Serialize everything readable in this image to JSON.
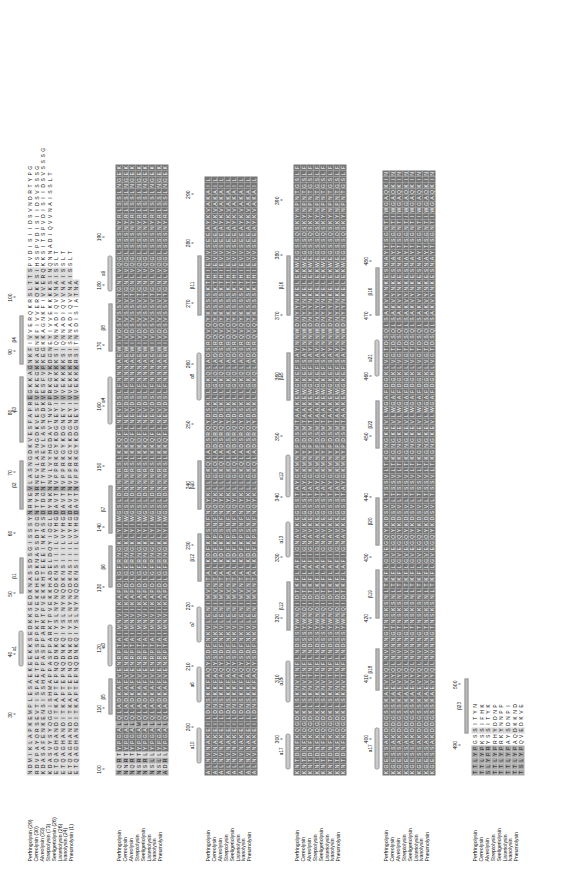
{
  "figure": {
    "type": "multiple-sequence-alignment",
    "orientation": "rotated-90-ccw",
    "block_count": 6,
    "sequence_count": 8
  },
  "sequences": [
    {
      "name": "Perfringolysin",
      "start_label": "Perfringolysin (29)",
      "start": 29
    },
    {
      "name": "Cereolysin",
      "start_label": "Cereolysin (30)",
      "start": 30
    },
    {
      "name": "Alveolysin",
      "start_label": "Alveolysin (33)",
      "start": 33
    },
    {
      "name": "Streptolysin",
      "start_label": "Streptolysin (73)",
      "start": 73
    },
    {
      "name": "Seeligeriolysin",
      "start_label": "Seeligeriolysin (26)",
      "start": 26
    },
    {
      "name": "Listeriolysin",
      "start_label": "Listeriolysin (26)",
      "start": 26
    },
    {
      "name": "Ivanolysin",
      "start_label": "Ivanolysin (24)",
      "start": 24
    },
    {
      "name": "Pneumolysin",
      "start_label": "Pneumolysin (1)",
      "start": 1
    }
  ],
  "names_plain": [
    "Perfringolysin",
    "Cereolysin",
    "Alveolysin",
    "Streptolysin",
    "Seeligeriolysin",
    "Listeriolysin",
    "Ivanolysin",
    "Pneumolysin"
  ],
  "colors": {
    "shade_light": "#d8d8d8",
    "shade_mid": "#a9a9a9",
    "shade_dark": "#767676",
    "ss_bar": "#b8b8b8",
    "text": "#111111",
    "background": "#ffffff"
  },
  "blocks": [
    {
      "id": "block-1",
      "range": [
        29,
        100
      ],
      "ruler": [
        {
          "value": "30",
          "col": 10
        },
        {
          "value": "40",
          "col": 20
        },
        {
          "value": "50",
          "col": 30
        },
        {
          "value": "60",
          "col": 40
        },
        {
          "value": "70",
          "col": 50
        },
        {
          "value": "80",
          "col": 60
        },
        {
          "value": "90",
          "col": 70
        },
        {
          "value": "100",
          "col": 79
        }
      ],
      "ss": [
        {
          "label": "α1",
          "type": "helix",
          "start": 18,
          "end": 24
        },
        {
          "label": "β 1",
          "type": "strand",
          "start": 30,
          "end": 36
        },
        {
          "label": "β2",
          "type": "strand",
          "start": 44,
          "end": 52
        },
        {
          "label": "β3",
          "type": "strand",
          "start": 55,
          "end": 66
        },
        {
          "label": "β4",
          "type": "strand",
          "start": 68,
          "end": 76
        }
      ],
      "rows": [
        "NDMIKLAPKEMPLESAEKEEKKSEDKKSEDKNASSDSGISSSYNRNEVLASNGDKVESFAPREGKKAGNKFIVVERQKRSLTTSPVDISIIDSVNDRTYPG",
        "RDVPAYQRSEVTISPAETPESSPPKTPVEKKHEDKNASSDTQGNTYNRNEVLASNGDKVESFVPKEGKKAGNKFIVVERQKKSIHSSPVDISIIDSVSSSG",
        "KDASAFENKENSISSHAPPASPPARKTPVEKKHTEEEINKASSDTDGNTYNRNEVLASNGDKVESFVPKEGKKAGNKFIVVERQKKSITSPVDISIIDSVSSSG",
        "KDASVYSYQGGISHMAPPASPPARKTPVEKKHADELDQYIQGLDYNKNNVLVYHGDAVTNVPPRKGYKDGNEYIVVEKKKKSINQNNADIQVVNAISSLT",
        "ETQAGHANDITKAPTEPNQDNKQIYSLNYNQDKNSIIILVYHGDAVTNVPPRKGYKDGNEYIVVEKKKKSIQNNADIQVVNAISSLT",
        "ETQAGHANDITKAPTEPNQDNKQIYSLNYNQDKNSIIILVYHGDAVTNVPPRKGYKDGNEYIVVEKKKKSIQNNADIQVVNAISSLT",
        "ETQAGHANDITKAPTEPNQDNKQIYSLNYNQDKNSIIILVYHGDAVTNVPPRKGYKDGNEYIVVEKKKRSISNNADIQVVNAISSLT",
        "ETQAGHANDITKAPTEPNQDNKQIYSLNYNQDKNSIIILVYHGDAVTNVPPRKGYKDGNEYIVVEKKKRSITNSDISIATNA"
      ]
    },
    {
      "id": "block-2",
      "range": [
        100,
        190
      ],
      "ruler": [
        {
          "value": "100",
          "col": 1
        },
        {
          "value": "110",
          "col": 11
        },
        {
          "value": "120",
          "col": 21
        },
        {
          "value": "130",
          "col": 31
        },
        {
          "value": "140",
          "col": 41
        },
        {
          "value": "150",
          "col": 51
        },
        {
          "value": "160",
          "col": 61
        },
        {
          "value": "170",
          "col": 71
        },
        {
          "value": "180",
          "col": 81
        },
        {
          "value": "190",
          "col": 89
        }
      ],
      "ss": [
        {
          "label": "β5",
          "type": "strand",
          "start": 10,
          "end": 16
        },
        {
          "label": "α3",
          "type": "helix",
          "start": 18,
          "end": 25
        },
        {
          "label": "β6",
          "type": "strand",
          "start": 31,
          "end": 38
        },
        {
          "label": "β7",
          "type": "strand",
          "start": 40,
          "end": 48
        },
        {
          "label": "α4",
          "type": "helix",
          "start": 58,
          "end": 66
        },
        {
          "label": "β8",
          "type": "strand",
          "start": 70,
          "end": 78
        },
        {
          "label": "α9",
          "type": "helix",
          "start": 80,
          "end": 86
        }
      ],
      "rows": [
        "NQRTYPGALQLADKAFVENRPTAIMNVIKAPDLGFRNGKLYIWGSLDNNNRSLKKQFLNEVDSLFNNNAEWIVDSVSSVTGNLVQGLSSSNYRLSSLNGEK",
        "NNRTYPGALQLADKAFVENRPTAIMNVIKAPDLGFRNGKLYIWGSLDNNNRSLKKQFLNEVDSLFNNNAEWIVDSVSSVTGNLVQGLSSSNYRLSSLNGEK",
        "NQRTYPGALQLADKAFVENRPTAIMNVIKAPDLGFRNGKLYIWGSLDNNNRSLKKQFLNEVDSLFNNNAEWIVDSVSSVTGNLVQGLSSSNYRLSSLNGEK",
        "NSRTYPGAMQLADKAFVENRPTAIMNVIKAPDLGFRNGKLYIWGSLDNNNRSLKKQFLNEVDSLFNNNAEWIVDSVSSVTGNLVQGLSSSNYRLSSLNGEK",
        "NSRLYPGALQLADKAFVENRPTAIMNVIKAPDLGFRNGKLYIWGSLDNNNRSLKKQFLNEVDSLFNNNAEWIVDSVSSVTGNLVQGLSSSNYRLSSLNGEK",
        "NSLLYPGALQLADKAFVENRPTAIMNVIKAPDLGFRNGKLYIWGSLDNNNRSLKKQFLNEVDSLFNNNAEWIVDSVSSVTGNLVQGLSSSNYRLSSLNGEK",
        "NSLLYPGALQLADKAFVENRPTAIMNVIKAPDLGFRNGKLYIWGSLDNNNRSLKKQFLNEVDSLFNNNAEWIVDSVSSVTGNLVQGLSSSNYRLSSLNGEK",
        "ADRLYPGALQLADKAFVENRPTAIMNVIKAPDLGFRNGKLYIWGSLDNNNRSLKKQFLNEVDSLFNNNAEWIVDSVSSVTGNLVQGLSSSNYRLSSLNGEK"
      ]
    },
    {
      "id": "block-3",
      "range": [
        190,
        290
      ],
      "ruler": [
        {
          "value": "200",
          "col": 8
        },
        {
          "value": "210",
          "col": 18
        },
        {
          "value": "220",
          "col": 28
        },
        {
          "value": "230",
          "col": 38
        },
        {
          "value": "240",
          "col": 48
        },
        {
          "value": "250",
          "col": 58
        },
        {
          "value": "260",
          "col": 68
        },
        {
          "value": "270",
          "col": 78
        },
        {
          "value": "280",
          "col": 88
        },
        {
          "value": "290",
          "col": 96
        }
      ],
      "ss": [
        {
          "label": "α10",
          "type": "helix",
          "start": 2,
          "end": 8
        },
        {
          "label": "α6",
          "type": "helix",
          "start": 12,
          "end": 18
        },
        {
          "label": "α7",
          "type": "helix",
          "start": 22,
          "end": 28
        },
        {
          "label": "β12",
          "type": "strand",
          "start": 32,
          "end": 40
        },
        {
          "label": "β10",
          "type": "strand",
          "start": 44,
          "end": 52
        },
        {
          "label": "α8",
          "type": "helix",
          "start": 62,
          "end": 70
        },
        {
          "label": "β11",
          "type": "strand",
          "start": 76,
          "end": 86
        }
      ],
      "rows": [
        "ALNVNAKEILDNSKKFAQYSDFNKVLENIMVNTALKDFKPSNFNQYKLLGKQLADSRQYDSKLLGKQLADSRQVQYKSSSKTHIEVVSEEAYKVAKAIL",
        "ALNVNAKEILDNSKKFAQYSDFNKVLENIMVNTALKDFKPSNFNQYKLLGKQLADSRQYDSKLLGKQLADSRQVQYKSSSKTHIEVVSEEAYKVAKAIL",
        "ALNVNAKEILDNSKKFAQYSDFNKVLENIMVNTALKDFKPSNFNQYKLLGKQLADSRQYDSKLLGKQLADSRQVQYKSSSKTHIEVVSEEAYKVAKAIL",
        "ALNVNAKEILDNSKKFAQYSDFNKVLENIMVNTALKDFKPSNFNQYKLLGKQLADSRQYDSKLLGKQLADSRQVQYKSSSKTHIEVVSEEAYKVAKAIL",
        "ALNVNAKEILDNSKKFAQYSDFNKVLENIMVNTALKDFKPSNFNQYKLLGKQLADSRQYDSKLLGKQLADSRQVQYKSSSKTHIEVVSEEAYKVAKAIL",
        "ALNVNAKEILDNSKKFAQYSDFNKVLENIMVNTALKDFKPSNFNQYKLLGKQLADSRQYDSKLLGKQLADSRQVQYKSSSKTHIEVVSEEAYKVAKAIL",
        "ALNVNAKEILDNSKKFAQYSDFNKVLENIMVNTALKDFKPSNFNQYKLLGKQLADSRQYDSKLLGKQLADSRQVQYKSSSKTHIEVVSEEAYKVAKAIL",
        "ALNVNAKEILDNSKKFAQYSDFNKVLENIMVNTALKDFKPSNFNQYKLLGKQLADSRQYDSKLLGKQLADSRQVQYKSSSKTHIEVVSEEAYKVAKAIL"
      ]
    },
    {
      "id": "block-4",
      "range": [
        290,
        390
      ],
      "ruler": [
        {
          "value": "300",
          "col": 6
        },
        {
          "value": "310",
          "col": 16
        },
        {
          "value": "320",
          "col": 26
        },
        {
          "value": "330",
          "col": 36
        },
        {
          "value": "340",
          "col": 46
        },
        {
          "value": "350",
          "col": 56
        },
        {
          "value": "360",
          "col": 66
        },
        {
          "value": "370",
          "col": 76
        },
        {
          "value": "380",
          "col": 86
        },
        {
          "value": "390",
          "col": 95
        }
      ],
      "ss": [
        {
          "label": "α17",
          "type": "helix",
          "start": 1,
          "end": 7
        },
        {
          "label": "α18",
          "type": "helix",
          "start": 12,
          "end": 19
        },
        {
          "label": "β12",
          "type": "strand",
          "start": 24,
          "end": 32
        },
        {
          "label": "α13",
          "type": "helix",
          "start": 36,
          "end": 42
        },
        {
          "label": "α12",
          "type": "helix",
          "start": 46,
          "end": 53
        },
        {
          "label": "β15",
          "type": "strand",
          "start": 62,
          "end": 70
        },
        {
          "label": "β16",
          "type": "strand",
          "start": 76,
          "end": 86
        }
      ],
      "rows": [
        "KNTDNFKQGDKLSKNVTNFLNDSSYWNQIDTKFLAFIGNAVKEGSSTAYGKMNYPDSMTAAKEWGKEFSAYNNWDNYYNKELEKWEGSSQSKYNPNTGSLF",
        "KNTDNFKQGDKLSKNVTNFLNDSSYWNQIDTKFLAFIGNAVKEGSSTAYGKMNYPDSMTAAKEWGKEFSAYNNWDNYYNKELEKWEGSSQSKYNPNTGSLF",
        "KNTDNFKQGDKLSKNVTNFLNDSSYWNQIDTKFLAFIGNAVKEGSSTAYGKMNYPDSMTAAKEWGKEFSAYNNWDNYYNKELEKWEGSSQSKYNPNTGSLF",
        "KNTDNFKQGDKLSKNVTNFLNDSSYWNQIDTKFLAFIGNAVKEGSSTAYGKMNYPDSMTAAKEWGKEFSAYNNWDNYYNKELEKWEGSSQSKYNPNTGSLF",
        "KNTDNFKQGDKLSKNVTNFLNDSSYWNQIDTKFLAFIGNAVKEGSSTAYGKMNYPDSMTAAKEWGKEFSAYNNWDNYYNKELEKWEGSSQSKYNPNTGSLF",
        "KNTDNFKQGDKLSKNVTNFLNDSSYWNQIDTKFLAFIGNAVKEGSSTAYGKMNYPDSMTAAKEWGKEFSAYNNWDNYYNKELEKWEGSSQSKYNPNTGSLF",
        "KNTDNFKQGDKLSKNVTNFLNDSSYWNQIDTKFLAFIGNAVKEGSSTAYGKMNYPDSMTAAKEWGKEFSAYNNWDNYYNKELEKWEGSSQSKYNPNTGSLF",
        "KNTDNFKQGDKLSKNVTNFLNDSSYWNQIDTKFLAFIGNAVKEGSSTAYGKMNYPDSMTAAKEWGKEFSAYNNWDNYYNKELEKWEGSSQSKYNPNTGSLF"
      ]
    },
    {
      "id": "block-5",
      "range": [
        390,
        480
      ],
      "ruler": [
        {
          "value": "400",
          "col": 6
        },
        {
          "value": "410",
          "col": 16
        },
        {
          "value": "420",
          "col": 26
        },
        {
          "value": "430",
          "col": 36
        },
        {
          "value": "440",
          "col": 46
        },
        {
          "value": "450",
          "col": 56
        },
        {
          "value": "460",
          "col": 66
        },
        {
          "value": "470",
          "col": 76
        },
        {
          "value": "480",
          "col": 85
        }
      ],
      "ss": [
        {
          "label": "α17",
          "type": "helix",
          "start": 1,
          "end": 8
        },
        {
          "label": "β18",
          "type": "strand",
          "start": 14,
          "end": 21
        },
        {
          "label": "β19",
          "type": "strand",
          "start": 26,
          "end": 34
        },
        {
          "label": "β20",
          "type": "strand",
          "start": 38,
          "end": 46
        },
        {
          "label": "β22",
          "type": "strand",
          "start": 54,
          "end": 62
        },
        {
          "label": "α21",
          "type": "helix",
          "start": 66,
          "end": 72
        },
        {
          "label": "β16",
          "type": "strand",
          "start": 76,
          "end": 84
        }
      ],
      "rows": [
        "KGESSAKDDGSSKAEVYQLNVNNGTNSKSNLTKFLGVEGQYKDSVLTSSVLTKGNGKEVLWGAFDGKLVGTDSQLSAKVYNKESNAYTSGNTIWGAQKIN",
        "KGESSAKDDGSSKAEVYQLNVNNGTNSKSNLTKFLGVEGQYKDSVLTSSVLTKGNGKEVLWGAFDGKLVGTDSQLSAKVYNKESNAYTSGNTIWGAQKIN",
        "KGESSAKDDGSSKAEVYQLNVNNGTNSKSNLTKFLGVEGQYKDSVLTSSVLTKGNGKEVLWGAFDGKLVGTDSQLSAKVYNKESNAYTSGNTIWGAQKIN",
        "KGESSAKDDGSSKAEVYQLNVNNGTNSKSNLTKFLGVEGQYKDSVLTSSVLTKGNGKEVLWGAFDGKLVGTDSQLSAKVYNKESNAYTSGNTIWGAQKIN",
        "KGESSAKDDGSSKAEVYQLNVNNGTNSKSNLTKFLGVEGQYKDSVLTSSVLTKGNGKEVLWGAFDGKLVGTDSQLSAKVYNKESNAYTSGNTIWGAQKIN",
        "KGESSAKDDGSSKAEVYQLNVNNGTNSKSNLTKFLGVEGQYKDSVLTSSVLTKGNGKEVLWGAFDGKLVGTDSQLSAKVYNKESNAYTSGNTIWGAQKIN",
        "KGESSAKDDGSSKAEVYQLNVNNGTNSKSNLTKFLGVEGQYKDSVLTSSVLTKGNGKEVLWGAFDGKLVGTDSQLSAKVYNKESNAYTSGNTIWGAQKIN",
        "KGESSAKDDGSSKAEVYQLNVNNGTNSKSNLTKFLGVEGQYKDSVLTSSVLTKGNGKEVLWGAFDGKLVGTDSQLSAKVYNKESNAYTSGNTIWGAQKIN"
      ]
    },
    {
      "id": "block-6",
      "range": [
        480,
        500
      ],
      "ruler": [
        {
          "value": "490",
          "col": 5
        },
        {
          "value": "500",
          "col": 15
        }
      ],
      "ss": [
        {
          "label": "β23",
          "type": "strand",
          "start": 7,
          "end": 16
        }
      ],
      "rows": [
        "TTLYPGSSITYN",
        "TTLYPKSSIFHK",
        "SLYPRYSSITYK",
        "TTLYPRHYDDNP",
        "TTLYPRKYNNPP",
        "TTLYPAYSDNPI",
        "TTLYPAQDKKND",
        "TSLYPQVEDKVE"
      ]
    }
  ]
}
